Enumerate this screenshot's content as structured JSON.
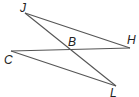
{
  "diagram": {
    "points": {
      "J": {
        "label": "J",
        "x": 25,
        "y": 13
      },
      "H": {
        "label": "H",
        "x": 130,
        "y": 48
      },
      "C": {
        "label": "C",
        "x": 11,
        "y": 51
      },
      "L": {
        "label": "L",
        "x": 116,
        "y": 86
      },
      "B": {
        "label": "B",
        "x": 72,
        "y": 50
      }
    },
    "segments": [
      "JH",
      "JL",
      "CH",
      "CL"
    ],
    "line_color": "#555555"
  }
}
